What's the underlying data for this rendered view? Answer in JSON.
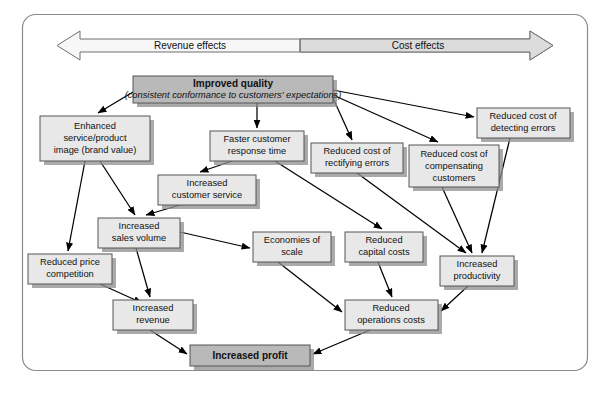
{
  "figure": {
    "frame": {
      "border_color": "#8a8a8a",
      "background": "#ffffff",
      "corner_radius": 12
    },
    "colors": {
      "node_fill": "#e8e8e8",
      "emphasis_fill": "#b9b9b9",
      "node_stroke": "#555555",
      "shadow": "#8e8e8e",
      "arrow": "#000000",
      "banner_left_fill": "#f7f7f7",
      "banner_right_fill": "#dcdcdc",
      "banner_stroke": "#6f6f6f",
      "text": "#111111"
    }
  },
  "banner": {
    "name": "revenue-cost-effects-banner",
    "left_label": "Revenue effects",
    "right_label": "Cost effects",
    "direction": "double-headed-arrow"
  },
  "nodes": [
    {
      "id": "improved-quality",
      "label_line1": "Improved quality",
      "label_line2": "(consistent conformance to customers' expectations)",
      "style": "emphasis",
      "x": 133,
      "y": 76,
      "w": 200,
      "h": 27
    },
    {
      "id": "enhanced-image",
      "label_line1": "Enhanced",
      "label_line2": "service/product",
      "label_line3": "image (brand value)",
      "style": "normal",
      "x": 40,
      "y": 116,
      "w": 110,
      "h": 45
    },
    {
      "id": "faster-response",
      "label_line1": "Faster customer",
      "label_line2": "response time",
      "style": "normal",
      "x": 210,
      "y": 131,
      "w": 94,
      "h": 30
    },
    {
      "id": "rectifying-errors",
      "label_line1": "Reduced cost of",
      "label_line2": "rectifying errors",
      "style": "normal",
      "x": 311,
      "y": 143,
      "w": 92,
      "h": 30
    },
    {
      "id": "compensating-customers",
      "label_line1": "Reduced cost of",
      "label_line2": "compensating",
      "label_line3": "customers",
      "style": "normal",
      "x": 409,
      "y": 145,
      "w": 90,
      "h": 42
    },
    {
      "id": "detecting-errors",
      "label_line1": "Reduced cost of",
      "label_line2": "detecting errors",
      "style": "normal",
      "x": 477,
      "y": 108,
      "w": 93,
      "h": 30
    },
    {
      "id": "increased-customer-service",
      "label_line1": "Increased",
      "label_line2": "customer service",
      "style": "normal",
      "x": 158,
      "y": 175,
      "w": 98,
      "h": 30
    },
    {
      "id": "increased-sales-volume",
      "label_line1": "Increased",
      "label_line2": "sales volume",
      "style": "normal",
      "x": 98,
      "y": 218,
      "w": 82,
      "h": 30
    },
    {
      "id": "reduced-price-competition",
      "label_line1": "Reduced price",
      "label_line2": "competition",
      "style": "normal",
      "x": 28,
      "y": 254,
      "w": 84,
      "h": 30
    },
    {
      "id": "economies-of-scale",
      "label_line1": "Economies of",
      "label_line2": "scale",
      "style": "normal",
      "x": 253,
      "y": 232,
      "w": 78,
      "h": 30
    },
    {
      "id": "reduced-capital-costs",
      "label_line1": "Reduced",
      "label_line2": "capital costs",
      "style": "normal",
      "x": 345,
      "y": 232,
      "w": 78,
      "h": 30
    },
    {
      "id": "increased-productivity",
      "label_line1": "Increased",
      "label_line2": "productivity",
      "style": "normal",
      "x": 440,
      "y": 256,
      "w": 74,
      "h": 30
    },
    {
      "id": "increased-revenue",
      "label_line1": "Increased",
      "label_line2": "revenue",
      "style": "normal",
      "x": 113,
      "y": 300,
      "w": 80,
      "h": 30
    },
    {
      "id": "reduced-operations-costs",
      "label_line1": "Reduced",
      "label_line2": "operations costs",
      "style": "normal",
      "x": 345,
      "y": 300,
      "w": 93,
      "h": 30
    },
    {
      "id": "increased-profit",
      "label_line1": "Increased profit",
      "style": "emphasis-bold",
      "x": 190,
      "y": 345,
      "w": 120,
      "h": 21
    }
  ],
  "edges": [
    {
      "from": "improved-quality",
      "to": "enhanced-image"
    },
    {
      "from": "improved-quality",
      "to": "faster-response"
    },
    {
      "from": "improved-quality",
      "to": "rectifying-errors"
    },
    {
      "from": "improved-quality",
      "to": "compensating-customers"
    },
    {
      "from": "improved-quality",
      "to": "detecting-errors"
    },
    {
      "from": "enhanced-image",
      "to": "increased-sales-volume"
    },
    {
      "from": "enhanced-image",
      "to": "reduced-price-competition"
    },
    {
      "from": "faster-response",
      "to": "increased-customer-service"
    },
    {
      "from": "faster-response",
      "to": "reduced-capital-costs"
    },
    {
      "from": "increased-customer-service",
      "to": "increased-sales-volume"
    },
    {
      "from": "increased-sales-volume",
      "to": "increased-revenue"
    },
    {
      "from": "increased-sales-volume",
      "to": "economies-of-scale"
    },
    {
      "from": "reduced-price-competition",
      "to": "increased-revenue"
    },
    {
      "from": "rectifying-errors",
      "to": "increased-productivity"
    },
    {
      "from": "compensating-customers",
      "to": "increased-productivity"
    },
    {
      "from": "detecting-errors",
      "to": "increased-productivity"
    },
    {
      "from": "economies-of-scale",
      "to": "reduced-operations-costs"
    },
    {
      "from": "reduced-capital-costs",
      "to": "reduced-operations-costs"
    },
    {
      "from": "increased-productivity",
      "to": "reduced-operations-costs"
    },
    {
      "from": "increased-revenue",
      "to": "increased-profit"
    },
    {
      "from": "reduced-operations-costs",
      "to": "increased-profit"
    }
  ]
}
